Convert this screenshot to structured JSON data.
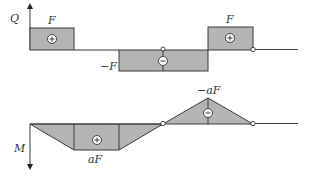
{
  "diagram": {
    "shear": {
      "axis_label": "Q",
      "labels": {
        "first_positive": "F",
        "negative": "−F",
        "second_positive": "F"
      },
      "segments": [
        {
          "span": [
            0,
            1
          ],
          "value": 1,
          "sign": "+"
        },
        {
          "span": [
            1,
            2
          ],
          "value": 0,
          "sign": ""
        },
        {
          "span": [
            2,
            4
          ],
          "value": -1,
          "sign": "−"
        },
        {
          "span": [
            4,
            5
          ],
          "value": 1,
          "sign": "+"
        }
      ]
    },
    "moment": {
      "axis_label": "M",
      "labels": {
        "positive": "aF",
        "negative": "−aF"
      },
      "points": [
        {
          "x": 0,
          "value": 0
        },
        {
          "x": 1,
          "value": 1
        },
        {
          "x": 2,
          "value": 1
        },
        {
          "x": 3,
          "value": 0
        },
        {
          "x": 4,
          "value": -1
        },
        {
          "x": 5,
          "value": 0
        }
      ],
      "signs": [
        "+",
        "−"
      ]
    },
    "hinges_at": [
      3,
      5
    ]
  }
}
